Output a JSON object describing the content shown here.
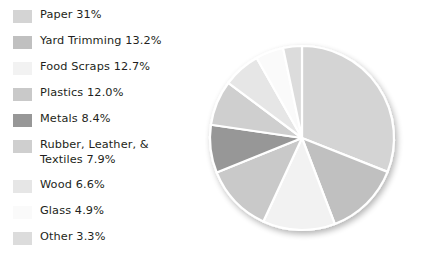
{
  "background_color": "#ffffff",
  "text_color": "#231f20",
  "separator_color": "#ffffff",
  "legend": {
    "items": [
      {
        "label": "Paper 31%",
        "name": "Paper",
        "value": 31.0,
        "color": "#d4d4d4"
      },
      {
        "label": "Yard Trimming 13.2%",
        "name": "Yard Trimming",
        "value": 13.2,
        "color": "#c0c0c0"
      },
      {
        "label": "Food Scraps 12.7%",
        "name": "Food Scraps",
        "value": 12.7,
        "color": "#f2f2f2"
      },
      {
        "label": "Plastics 12.0%",
        "name": "Plastics",
        "value": 12.0,
        "color": "#c9c9c9"
      },
      {
        "label": "Metals 8.4%",
        "name": "Metals",
        "value": 8.4,
        "color": "#979797"
      },
      {
        "label": "Rubber, Leather, &\nTextiles 7.9%",
        "name": "Rubber, Leather, & Textiles",
        "value": 7.9,
        "color": "#cfcfcf"
      },
      {
        "label": "Wood 6.6%",
        "name": "Wood",
        "value": 6.6,
        "color": "#e6e6e6"
      },
      {
        "label": "Glass 4.9%",
        "name": "Glass",
        "value": 4.9,
        "color": "#fafafa"
      },
      {
        "label": "Other 3.3%",
        "name": "Other",
        "value": 3.3,
        "color": "#dcdcdc"
      }
    ]
  },
  "chart_data": {
    "type": "pie",
    "title": "",
    "labels": [
      "Paper",
      "Yard Trimming",
      "Food Scraps",
      "Plastics",
      "Metals",
      "Rubber, Leather, & Textiles",
      "Wood",
      "Glass",
      "Other"
    ],
    "values": [
      31.0,
      13.2,
      12.7,
      12.0,
      8.4,
      7.9,
      6.6,
      4.9,
      3.3
    ],
    "value_unit": "percent",
    "total": 100.0,
    "colors": [
      "#d4d4d4",
      "#c0c0c0",
      "#f2f2f2",
      "#c9c9c9",
      "#979797",
      "#cfcfcf",
      "#e6e6e6",
      "#fafafa",
      "#dcdcdc"
    ],
    "start_angle_deg": 0,
    "direction": "clockwise",
    "legend_position": "left",
    "grid": false,
    "center_x": 97,
    "center_y": 100,
    "radius": 92,
    "slice_border_color": "#ffffff",
    "slice_border_width": 2.2
  }
}
